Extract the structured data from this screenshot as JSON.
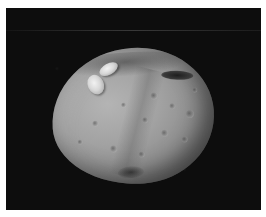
{
  "image": {
    "subject": "Asteroid Vesta",
    "description": "Grayscale photograph of a cratered, irregularly shaped asteroid against a black starless background",
    "background_color": "#0c0c0c",
    "border_color": "#ffffff",
    "surface_color": "#a0a0a0"
  },
  "features": [
    {
      "name": "bright-twin-craters",
      "label": "Bright snowman-shaped crater pair (upper left)"
    },
    {
      "name": "dark-crater-streak",
      "label": "Dark elongated crater (upper right)"
    },
    {
      "name": "southern-pit",
      "label": "Dark crater cluster near bottom"
    }
  ]
}
